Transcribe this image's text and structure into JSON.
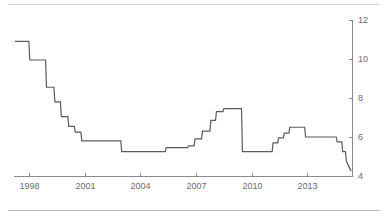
{
  "chart_data": {
    "type": "line",
    "title": "",
    "subtitle": "",
    "xlabel": "",
    "ylabel": "",
    "xlim": [
      1997.2,
      2015.4
    ],
    "ylim": [
      4,
      12
    ],
    "grid": false,
    "legend": null,
    "step_style": "post",
    "x_ticks": [
      1998,
      2001,
      2004,
      2007,
      2010,
      2013
    ],
    "x_tick_labels": [
      "1998",
      "2001",
      "2004",
      "2007",
      "2010",
      "2013"
    ],
    "y_ticks": [
      4,
      6,
      8,
      10,
      12
    ],
    "y_tick_labels": [
      "4",
      "6",
      "8",
      "10",
      "12"
    ],
    "y_axis_position": "right",
    "line_color": "#5a5a60",
    "axis_color": "#8a8a92",
    "text_color": "#6b6b72",
    "series": [
      {
        "name": "rate",
        "x": [
          1997.25,
          1998.0,
          1998.05,
          1998.9,
          1998.95,
          1999.35,
          1999.4,
          1999.7,
          1999.75,
          2000.1,
          2000.15,
          2000.45,
          2000.5,
          2000.8,
          2000.85,
          2002.95,
          2003.0,
          2005.35,
          2005.4,
          2006.55,
          2006.6,
          2006.9,
          2006.95,
          2007.3,
          2007.35,
          2007.75,
          2007.8,
          2008.05,
          2008.1,
          2008.45,
          2008.5,
          2009.45,
          2009.5,
          2011.1,
          2011.15,
          2011.4,
          2011.45,
          2011.7,
          2011.75,
          2012.0,
          2012.05,
          2012.85,
          2012.9,
          2014.55,
          2014.6,
          2014.85,
          2014.9,
          2015.05,
          2015.1,
          2015.35
        ],
        "y": [
          10.9,
          10.9,
          9.95,
          9.95,
          8.55,
          8.55,
          7.8,
          7.8,
          7.05,
          7.05,
          6.55,
          6.55,
          6.25,
          6.25,
          5.8,
          5.8,
          5.25,
          5.25,
          5.45,
          5.45,
          5.55,
          5.55,
          5.9,
          5.9,
          6.3,
          6.3,
          6.85,
          6.85,
          7.3,
          7.3,
          7.45,
          7.45,
          5.25,
          5.25,
          5.7,
          5.7,
          5.95,
          5.95,
          6.2,
          6.2,
          6.5,
          6.5,
          6.0,
          6.0,
          5.75,
          5.75,
          5.25,
          5.25,
          4.75,
          4.25
        ]
      }
    ]
  },
  "axes": {
    "y_axis_name": "value-axis-right",
    "x_axis_name": "time-axis-bottom"
  }
}
